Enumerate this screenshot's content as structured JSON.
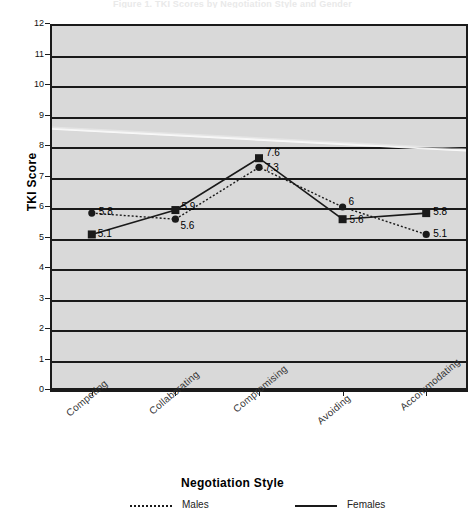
{
  "figure": {
    "cut_title": "Figure 1.  TKI Scores by Negotiation Style and Gender",
    "yaxis_title": "TKI Score",
    "xaxis_title": "Negotiation Style"
  },
  "chart_data": {
    "type": "line",
    "title": "",
    "xlabel": "Negotiation Style",
    "ylabel": "TKI Score",
    "categories": [
      "Competing",
      "Collaborating",
      "Compromising",
      "Avoiding",
      "Accommodating"
    ],
    "ylim": [
      0,
      12
    ],
    "yticks": [
      "0",
      "1",
      "2",
      "3",
      "4",
      "5",
      "6",
      "7",
      "8",
      "9",
      "10",
      "11",
      "12"
    ],
    "grid": "horizontal",
    "legend_position": "bottom",
    "series": [
      {
        "name": "Males",
        "marker": "circle",
        "line_style": "dotted",
        "color": "#1a1a1a",
        "values": [
          5.8,
          5.6,
          7.3,
          6.0,
          5.1
        ],
        "labels": [
          "5.8",
          "5.6",
          "7.3",
          "6",
          "5.1"
        ]
      },
      {
        "name": "Females",
        "marker": "square",
        "line_style": "solid",
        "color": "#1a1a1a",
        "values": [
          5.1,
          5.9,
          7.6,
          5.6,
          5.8
        ],
        "labels": [
          "5.1",
          "5.9",
          "7.6",
          "5.6",
          "5.8"
        ]
      }
    ]
  },
  "legend": {
    "items": [
      {
        "label": "Males",
        "style": "dotted"
      },
      {
        "label": "Females",
        "style": "solid"
      }
    ]
  }
}
